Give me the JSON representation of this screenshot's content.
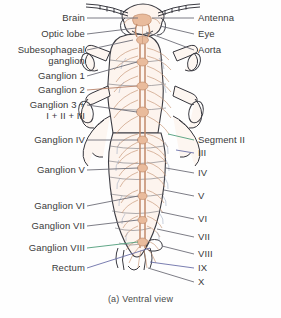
{
  "figure": {
    "caption": "(a) Ventral view"
  },
  "colors": {
    "background": "#fefefe",
    "label_text": "#3a3a3a",
    "leader_default": "#6e6e78",
    "leader_green": "#4f9d7a",
    "leader_blue": "#6b6fa8",
    "body_outline": "#3b3b42",
    "nerve_cord": "#c08a6a",
    "nerve_branch": "#c99b7c",
    "nerve_fine": "#9aa7bd",
    "body_fill": "#fdf4ee"
  },
  "labels_left": [
    {
      "id": "brain",
      "text": "Brain",
      "text2": "",
      "leader": "default"
    },
    {
      "id": "optic-lobe",
      "text": "Optic lobe",
      "text2": "",
      "leader": "default"
    },
    {
      "id": "subesophageal",
      "text": "Subesophageal",
      "text2": "ganglion",
      "leader": "default"
    },
    {
      "id": "ganglion-1",
      "text": "Ganglion 1",
      "text2": "",
      "leader": "default"
    },
    {
      "id": "ganglion-2",
      "text": "Ganglion 2",
      "text2": "",
      "leader": "default"
    },
    {
      "id": "ganglion-3",
      "text": "Ganglion 3 +",
      "text2": "I + II + III",
      "leader": "default"
    },
    {
      "id": "ganglion-4",
      "text": "Ganglion IV",
      "text2": "",
      "leader": "default"
    },
    {
      "id": "ganglion-5",
      "text": "Ganglion V",
      "text2": "",
      "leader": "default"
    },
    {
      "id": "ganglion-6",
      "text": "Ganglion VI",
      "text2": "",
      "leader": "default"
    },
    {
      "id": "ganglion-7",
      "text": "Ganglion VII",
      "text2": "",
      "leader": "default"
    },
    {
      "id": "ganglion-8",
      "text": "Ganglion VIII",
      "text2": "",
      "leader": "green"
    },
    {
      "id": "rectum",
      "text": "Rectum",
      "text2": "",
      "leader": "blue"
    }
  ],
  "labels_right": [
    {
      "id": "antenna",
      "text": "Antenna",
      "leader": "default"
    },
    {
      "id": "eye",
      "text": "Eye",
      "leader": "default"
    },
    {
      "id": "aorta",
      "text": "Aorta",
      "leader": "default"
    },
    {
      "id": "segment-2",
      "text": "Segment II",
      "leader": "green"
    },
    {
      "id": "segment-3",
      "text": "III",
      "leader": "blue"
    },
    {
      "id": "segment-4",
      "text": "IV",
      "leader": "default"
    },
    {
      "id": "segment-5",
      "text": "V",
      "leader": "default"
    },
    {
      "id": "segment-6",
      "text": "VI",
      "leader": "default"
    },
    {
      "id": "segment-7",
      "text": "VII",
      "leader": "default"
    },
    {
      "id": "segment-8",
      "text": "VIII",
      "leader": "default"
    },
    {
      "id": "segment-9",
      "text": "IX",
      "leader": "default"
    },
    {
      "id": "segment-10",
      "text": "X",
      "leader": "default"
    }
  ]
}
